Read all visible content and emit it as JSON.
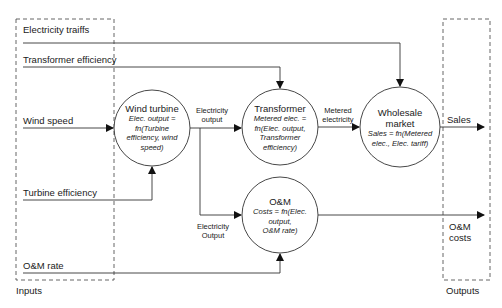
{
  "groups": {
    "inputs_label": "Inputs",
    "outputs_label": "Outputs"
  },
  "inputs": [
    {
      "id": "tariffs",
      "label": "Electricity traiffs"
    },
    {
      "id": "transformer_eff",
      "label": "Transformer efficiency"
    },
    {
      "id": "wind_speed",
      "label": "Wind speed"
    },
    {
      "id": "turbine_eff",
      "label": "Turbine efficiency"
    },
    {
      "id": "om_rate",
      "label": "O&M rate"
    }
  ],
  "nodes": {
    "wind_turbine": {
      "title": "Wind turbine",
      "formula": "Elec. output = fn(Turbine efficiency, wind speed)",
      "formula_lines": [
        "Elec. output =",
        "fn(Turbine",
        "efficiency, wind",
        "speed)"
      ]
    },
    "transformer": {
      "title": "Transformer",
      "formula": "Metered elec. = fn(Elec. output, Transformer efficiency)",
      "formula_lines": [
        "Metered elec. =",
        "fn(Elec. output,",
        "Transformer",
        "efficiency)"
      ]
    },
    "wholesale": {
      "title": "Wholesale market",
      "title_lines": [
        "Wholesale",
        "market"
      ],
      "formula": "Sales = fn(Metered elec., Elec. tariff)",
      "formula_lines": [
        "Sales = fn(Metered",
        "elec., Elec. tariff)"
      ]
    },
    "om": {
      "title": "O&M",
      "formula": "Costs = fn(Elec. output, O&M rate)",
      "formula_lines": [
        "Costs = fn(Elec.",
        "output,",
        "O&M rate)"
      ]
    }
  },
  "edges": {
    "elec_output_label": [
      "Electricity",
      "output"
    ],
    "metered_label": [
      "Metered",
      "electricity"
    ],
    "elec_output_om_label": [
      "Electricity",
      "Output"
    ]
  },
  "outputs": [
    {
      "id": "sales",
      "label": "Sales"
    },
    {
      "id": "om_costs",
      "label_lines": [
        "O&M",
        "costs"
      ]
    }
  ]
}
